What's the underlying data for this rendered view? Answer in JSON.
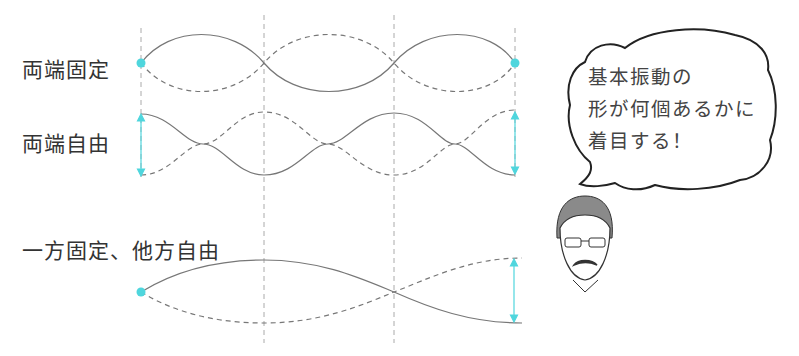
{
  "rows": [
    {
      "label": "両端固定",
      "type": "fixed-fixed"
    },
    {
      "label": "両端自由",
      "type": "free-free"
    },
    {
      "label": "一方固定、他方自由",
      "type": "fixed-free"
    }
  ],
  "speech_bubble": {
    "lines": [
      "基本振動の",
      "形が何個あるかに",
      "着目する！"
    ]
  },
  "colors": {
    "wave": "#777777",
    "guide": "#aaaaaa",
    "accent": "#4fd6dd",
    "text": "#333333"
  }
}
